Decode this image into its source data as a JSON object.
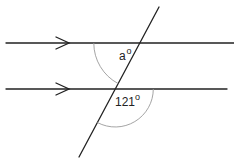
{
  "diagram": {
    "type": "parallel-lines-transversal",
    "parallel_lines": 2,
    "parallel_marker": "single-arrow",
    "angles": [
      {
        "id": "unknown",
        "text": "a",
        "unit": "o",
        "position": "upper-intersection, below-left of transversal"
      },
      {
        "id": "given",
        "text": "121",
        "unit": "o",
        "position": "lower-intersection, below-right reflex side"
      }
    ]
  }
}
